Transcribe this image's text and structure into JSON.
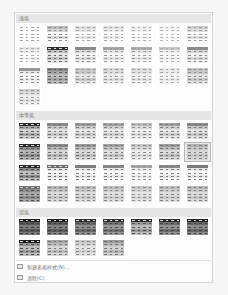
{
  "gallery": {
    "sections": [
      {
        "id": "light",
        "label": "浅色",
        "top": 1,
        "grid_top": 12,
        "thumbs": [
          {
            "h": "#ffffff",
            "a": "#ffffff",
            "b": "#ffffff",
            "line": "#a0a0a0"
          },
          {
            "h": "#bdbdbd",
            "a": "#d8d8d8",
            "b": "#ffffff",
            "line": "#8a8a8a"
          },
          {
            "h": "#dedede",
            "a": "#e8e8e8",
            "b": "#ffffff",
            "line": "#a8a8a8"
          },
          {
            "h": "#e2e2e2",
            "a": "#ececec",
            "b": "#ffffff",
            "line": "#a8a8a8"
          },
          {
            "h": "#ededed",
            "a": "#f2f2f2",
            "b": "#ffffff",
            "line": "#b0b0b0"
          },
          {
            "h": "#f2f2f2",
            "a": "#f6f6f6",
            "b": "#ffffff",
            "line": "#b8b8b8"
          },
          {
            "h": "#d0d0d0",
            "a": "#e0e0e0",
            "b": "#ffffff",
            "line": "#9a9a9a"
          },
          {
            "h": "#e6e6e6",
            "a": "#efefef",
            "b": "#ffffff",
            "line": "#a8a8a8"
          },
          {
            "h": "#2e2e2e",
            "a": "#c4c4c4",
            "b": "#e6e6e6",
            "line": "#6a6a6a"
          },
          {
            "h": "#8a8a8a",
            "a": "#dadada",
            "b": "#f2f2f2",
            "line": "#8a8a8a"
          },
          {
            "h": "#a8a8a8",
            "a": "#e2e2e2",
            "b": "#f6f6f6",
            "line": "#9a9a9a"
          },
          {
            "h": "#b0b0b0",
            "a": "#e6e6e6",
            "b": "#f8f8f8",
            "line": "#9a9a9a"
          },
          {
            "h": "#c8c8c8",
            "a": "#ececec",
            "b": "#fafafa",
            "line": "#a8a8a8"
          },
          {
            "h": "#8e8e8e",
            "a": "#d6d6d6",
            "b": "#f0f0f0",
            "line": "#8a8a8a"
          },
          {
            "h": "#9a9a9a",
            "a": "#e8e8e8",
            "b": "#ffffff",
            "line": "#8a8a8a"
          },
          {
            "h": "#8a8a8a",
            "a": "#a6a6a6",
            "b": "#bcbcbc",
            "line": "#5e5e5e"
          },
          {
            "h": "#c8c8c8",
            "a": "#c8c8c8",
            "b": "#e6e6e6",
            "line": "#9a9a9a"
          },
          {
            "h": "#d8d8d8",
            "a": "#dcdcdc",
            "b": "#f0f0f0",
            "line": "#9a9a9a"
          },
          {
            "h": "#dcdcdc",
            "a": "#e2e2e2",
            "b": "#f4f4f4",
            "line": "#a0a0a0"
          },
          {
            "h": "#e6e6e6",
            "a": "#eaeaea",
            "b": "#f8f8f8",
            "line": "#a8a8a8"
          },
          {
            "h": "#c2c2c2",
            "a": "#c8c8c8",
            "b": "#e2e2e2",
            "line": "#8e8e8e"
          },
          {
            "h": "#cfcfcf",
            "a": "#dedede",
            "b": "#eeeeee",
            "line": "#9a9a9a"
          }
        ]
      },
      {
        "id": "medium",
        "label": "中等色",
        "top": 98,
        "grid_top": 109,
        "thumbs": [
          {
            "h": "#2a2a2a",
            "a": "#a8a8a8",
            "b": "#d0d0d0",
            "line": "#5a5a5a"
          },
          {
            "h": "#8c8c8c",
            "a": "#c6c6c6",
            "b": "#e2e2e2",
            "line": "#7a7a7a"
          },
          {
            "h": "#9c9c9c",
            "a": "#cacaca",
            "b": "#e6e6e6",
            "line": "#808080"
          },
          {
            "h": "#a4a4a4",
            "a": "#cecece",
            "b": "#e8e8e8",
            "line": "#858585"
          },
          {
            "h": "#bcbcbc",
            "a": "#dadada",
            "b": "#efefef",
            "line": "#8e8e8e"
          },
          {
            "h": "#a0a0a0",
            "a": "#cccccc",
            "b": "#e8e8e8",
            "line": "#808080"
          },
          {
            "h": "#8a8a8a",
            "a": "#c4c4c4",
            "b": "#e2e2e2",
            "line": "#7a7a7a"
          },
          {
            "h": "#2a2a2a",
            "a": "#8c8c8c",
            "b": "#b4b4b4",
            "line": "#4e4e4e"
          },
          {
            "h": "#8a8a8a",
            "a": "#b8b8b8",
            "b": "#d6d6d6",
            "line": "#6e6e6e"
          },
          {
            "h": "#9a9a9a",
            "a": "#bebebe",
            "b": "#dadada",
            "line": "#727272"
          },
          {
            "h": "#a2a2a2",
            "a": "#c4c4c4",
            "b": "#dedede",
            "line": "#7a7a7a"
          },
          {
            "h": "#c4c4c4",
            "a": "#d8d8d8",
            "b": "#ececec",
            "line": "#8a8a8a"
          },
          {
            "h": "#9c9c9c",
            "a": "#bebebe",
            "b": "#dadada",
            "line": "#727272"
          },
          {
            "h": "#b2b2b2",
            "a": "#c6c6c6",
            "b": "#d6d6d6",
            "line": "#7e7e7e",
            "selected": true
          },
          {
            "h": "#2a2a2a",
            "a": "#8a8a8a",
            "b": "#bdbdbd",
            "line": "#4e4e4e"
          },
          {
            "h": "#6e6e6e",
            "a": "#e6e6e6",
            "b": "#ffffff",
            "line": "#6e6e6e"
          },
          {
            "h": "#7e7e7e",
            "a": "#e6e6e6",
            "b": "#ffffff",
            "line": "#7a7a7a"
          },
          {
            "h": "#888888",
            "a": "#e8e8e8",
            "b": "#ffffff",
            "line": "#7e7e7e"
          },
          {
            "h": "#a8a8a8",
            "a": "#ececec",
            "b": "#ffffff",
            "line": "#8a8a8a"
          },
          {
            "h": "#8a8a8a",
            "a": "#e8e8e8",
            "b": "#ffffff",
            "line": "#7e7e7e"
          },
          {
            "h": "#7a7a7a",
            "a": "#e6e6e6",
            "b": "#ffffff",
            "line": "#7a7a7a"
          },
          {
            "h": "#6e6e6e",
            "a": "#8e8e8e",
            "b": "#a8a8a8",
            "line": "#4e4e4e"
          },
          {
            "h": "#b6b6b6",
            "a": "#c6c6c6",
            "b": "#d8d8d8",
            "line": "#7e7e7e"
          },
          {
            "h": "#bcbcbc",
            "a": "#cacaca",
            "b": "#dcdcdc",
            "line": "#828282"
          },
          {
            "h": "#c0c0c0",
            "a": "#cecece",
            "b": "#dedede",
            "line": "#868686"
          },
          {
            "h": "#cacaca",
            "a": "#d6d6d6",
            "b": "#e6e6e6",
            "line": "#8e8e8e"
          },
          {
            "h": "#bebebe",
            "a": "#cccccc",
            "b": "#dcdcdc",
            "line": "#828282"
          },
          {
            "h": "#b8b8b8",
            "a": "#c8c8c8",
            "b": "#dadada",
            "line": "#7e7e7e"
          }
        ]
      },
      {
        "id": "dark",
        "label": "深色",
        "top": 195,
        "grid_top": 205,
        "thumbs": [
          {
            "h": "#1e1e1e",
            "a": "#5a5a5a",
            "b": "#7a7a7a",
            "line": "#3a3a3a"
          },
          {
            "h": "#1e1e1e",
            "a": "#5e5e5e",
            "b": "#828282",
            "line": "#3a3a3a"
          },
          {
            "h": "#2e2e2e",
            "a": "#6a6a6a",
            "b": "#8e8e8e",
            "line": "#454545"
          },
          {
            "h": "#2e2e2e",
            "a": "#727272",
            "b": "#989898",
            "line": "#4a4a4a"
          },
          {
            "h": "#2a2a2a",
            "a": "#9a9a9a",
            "b": "#bcbcbc",
            "line": "#555555"
          },
          {
            "h": "#2a2a2a",
            "a": "#6e6e6e",
            "b": "#929292",
            "line": "#454545"
          },
          {
            "h": "#1e1e1e",
            "a": "#6a6a6a",
            "b": "#8c8c8c",
            "line": "#404040"
          },
          {
            "h": "#1e1e1e",
            "a": "#9a9a9a",
            "b": "#bcbcbc",
            "line": "#4a4a4a"
          },
          {
            "h": "#a6a6a6",
            "a": "#bcbcbc",
            "b": "#d6d6d6",
            "line": "#7a7a7a"
          },
          {
            "h": "#c6c6c6",
            "a": "#d2d2d2",
            "b": "#e4e4e4",
            "line": "#8a8a8a"
          },
          {
            "h": "#9a9a9a",
            "a": "#b8b8b8",
            "b": "#d2d2d2",
            "line": "#747474"
          }
        ]
      }
    ]
  },
  "menu": {
    "new_style": {
      "label": "新建表格样式(N)...",
      "icon": "new-table-style-icon"
    },
    "clear": {
      "label": "清除(C)",
      "icon": "clear-icon"
    }
  }
}
